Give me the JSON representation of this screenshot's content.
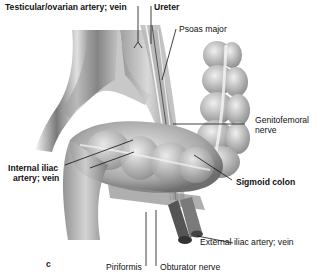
{
  "figure": {
    "panel_letter": "c",
    "labels": [
      {
        "id": "testicular",
        "text": "Testicular/ovarian artery; vein",
        "bold": true
      },
      {
        "id": "ureter",
        "text": "Ureter",
        "bold": true
      },
      {
        "id": "psoas",
        "text": "Psoas major",
        "bold": false
      },
      {
        "id": "genitofemoral_1",
        "text": "Genitofemoral",
        "bold": false
      },
      {
        "id": "genitofemoral_2",
        "text": "nerve",
        "bold": false
      },
      {
        "id": "internal_iliac_1",
        "text": "Internal iliac",
        "bold": true
      },
      {
        "id": "internal_iliac_2",
        "text": "artery; vein",
        "bold": true
      },
      {
        "id": "sigmoid",
        "text": "Sigmoid colon",
        "bold": true
      },
      {
        "id": "external_iliac",
        "text": "External iliac artery; vein",
        "bold": false
      },
      {
        "id": "piriformis",
        "text": "Piriformis",
        "bold": false
      },
      {
        "id": "obturator",
        "text": "Obturator nerve",
        "bold": false
      }
    ]
  }
}
